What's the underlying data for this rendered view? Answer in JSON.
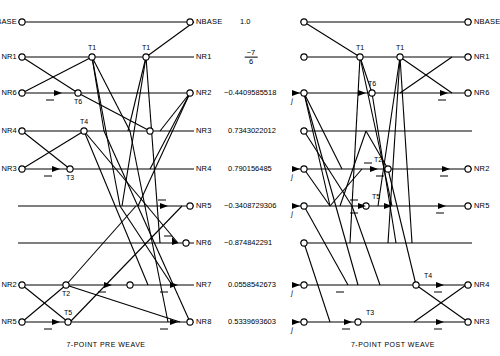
{
  "figure": {
    "left_caption": "7-POINT PRE WEAVE",
    "right_caption": "7-POINT POST WEAVE"
  },
  "left_diagram": {
    "input_labels": [
      "NBASE",
      "NR1",
      "NR6",
      "NR4",
      "NR3",
      "NR2",
      "NR5"
    ],
    "output_labels": [
      "NBASE",
      "NR1",
      "NR2",
      "NR3",
      "NR4",
      "NR5",
      "NR6",
      "NR7",
      "NR8"
    ],
    "node_labels": [
      "T1",
      "T1",
      "T6",
      "T4",
      "T3",
      "T2",
      "T5",
      "T2"
    ]
  },
  "center_values": {
    "items": [
      {
        "label": "1.0",
        "type": "decimal"
      },
      {
        "numerator": "−7",
        "denominator": "6",
        "type": "fraction"
      },
      {
        "label": "−0.4409585518",
        "type": "decimal"
      },
      {
        "label": "0.7343022012",
        "type": "decimal"
      },
      {
        "label": "0.790156485",
        "type": "decimal"
      },
      {
        "label": "−0.3408729306",
        "type": "decimal"
      },
      {
        "label": "−0.874842291",
        "type": "decimal"
      },
      {
        "label": "0.0558542673",
        "type": "decimal"
      },
      {
        "label": "0.5339693603",
        "type": "decimal"
      }
    ]
  },
  "right_diagram": {
    "output_labels": [
      "NBASE",
      "NR1",
      "NR6",
      "NR2",
      "NR5",
      "NR4",
      "NR3"
    ],
    "node_labels": [
      "T1",
      "T1",
      "T6",
      "T2",
      "T5",
      "T4",
      "T3"
    ],
    "input_markers": [
      "j",
      "j",
      "j",
      "j",
      "j"
    ]
  }
}
